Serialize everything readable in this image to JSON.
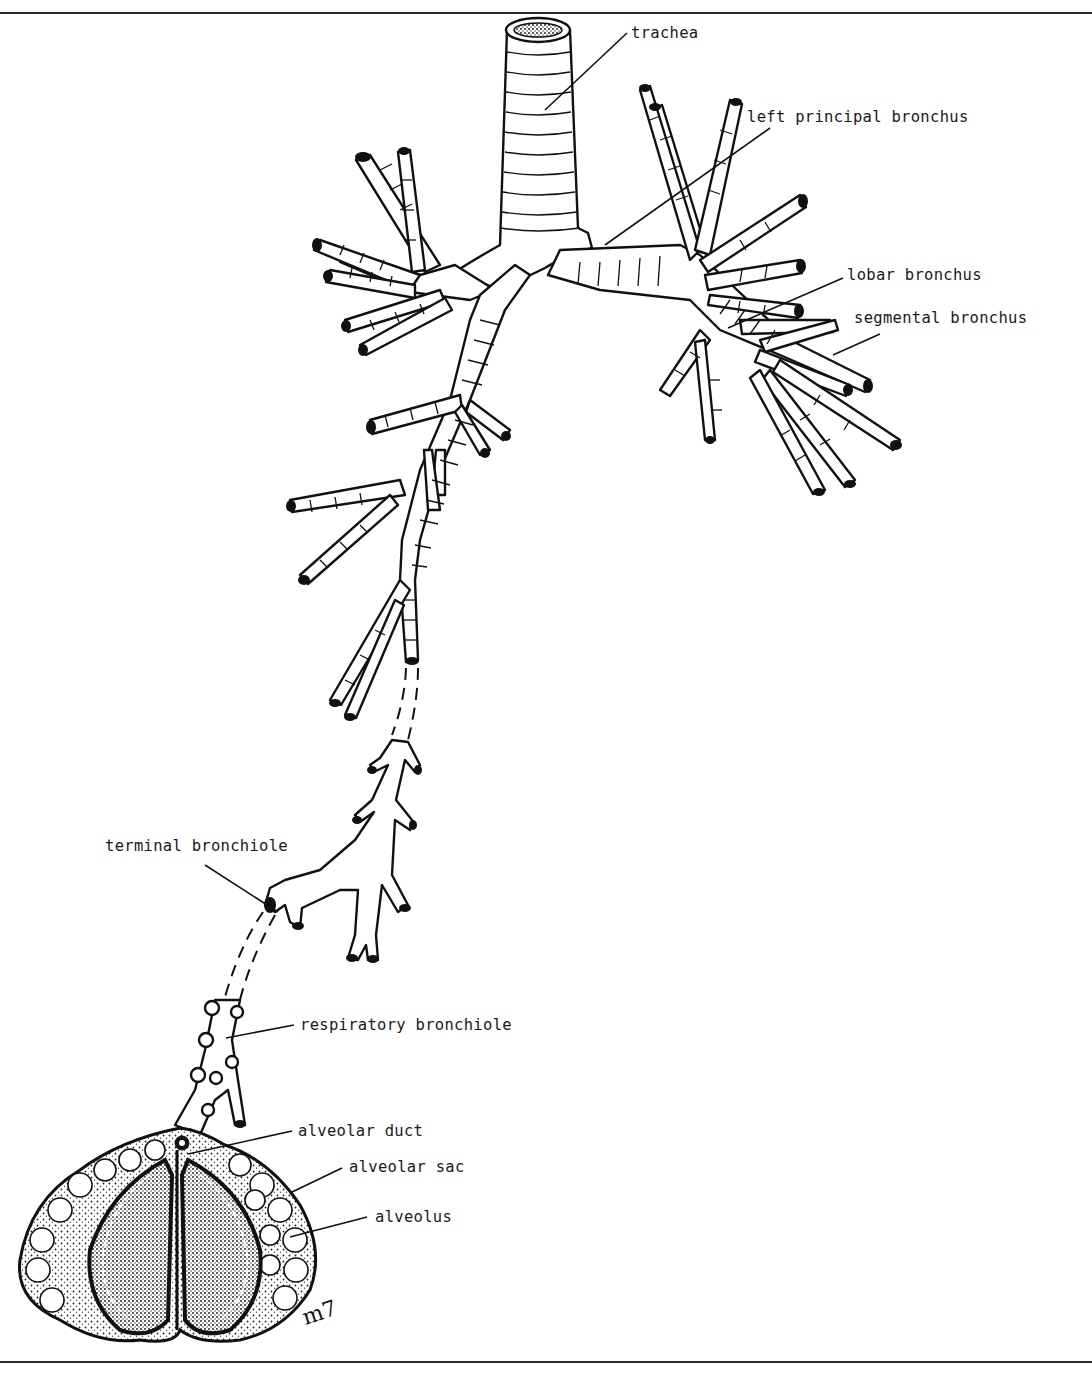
{
  "figure": {
    "border": {
      "top_rule_y": 12,
      "bottom_rule_y": 1361,
      "color": "#2a2a2a"
    },
    "ink_color": "#111111",
    "background": "#ffffff",
    "signature": "m7"
  },
  "labels": [
    {
      "id": "trachea",
      "text": "trachea",
      "x": 631,
      "y": 24,
      "leader": [
        [
          627,
          33
        ],
        [
          545,
          110
        ]
      ]
    },
    {
      "id": "left-principal-bronchus",
      "text": "left principal bronchus",
      "x": 747,
      "y": 108,
      "leader": [
        [
          770,
          128
        ],
        [
          605,
          245
        ]
      ]
    },
    {
      "id": "lobar-bronchus",
      "text": "lobar bronchus",
      "x": 847,
      "y": 266,
      "leader": [
        [
          843,
          278
        ],
        [
          728,
          328
        ]
      ]
    },
    {
      "id": "segmental-bronchus",
      "text": "segmental bronchus",
      "x": 854,
      "y": 309,
      "leader": [
        [
          880,
          334
        ],
        [
          833,
          355
        ]
      ]
    },
    {
      "id": "terminal-bronchiole",
      "text": "terminal bronchiole",
      "x": 105,
      "y": 837,
      "leader": [
        [
          205,
          865
        ],
        [
          278,
          912
        ]
      ]
    },
    {
      "id": "respiratory-bronchiole",
      "text": "respiratory bronchiole",
      "x": 300,
      "y": 1016,
      "leader": [
        [
          294,
          1025
        ],
        [
          226,
          1038
        ]
      ]
    },
    {
      "id": "alveolar-duct",
      "text": "alveolar duct",
      "x": 298,
      "y": 1122,
      "leader": [
        [
          292,
          1131
        ],
        [
          188,
          1154
        ]
      ]
    },
    {
      "id": "alveolar-sac",
      "text": "alveolar sac",
      "x": 349,
      "y": 1158,
      "leader": [
        [
          342,
          1168
        ],
        [
          290,
          1193
        ]
      ]
    },
    {
      "id": "alveolus",
      "text": "alveolus",
      "x": 375,
      "y": 1208,
      "leader": [
        [
          367,
          1217
        ],
        [
          290,
          1237
        ]
      ]
    }
  ]
}
